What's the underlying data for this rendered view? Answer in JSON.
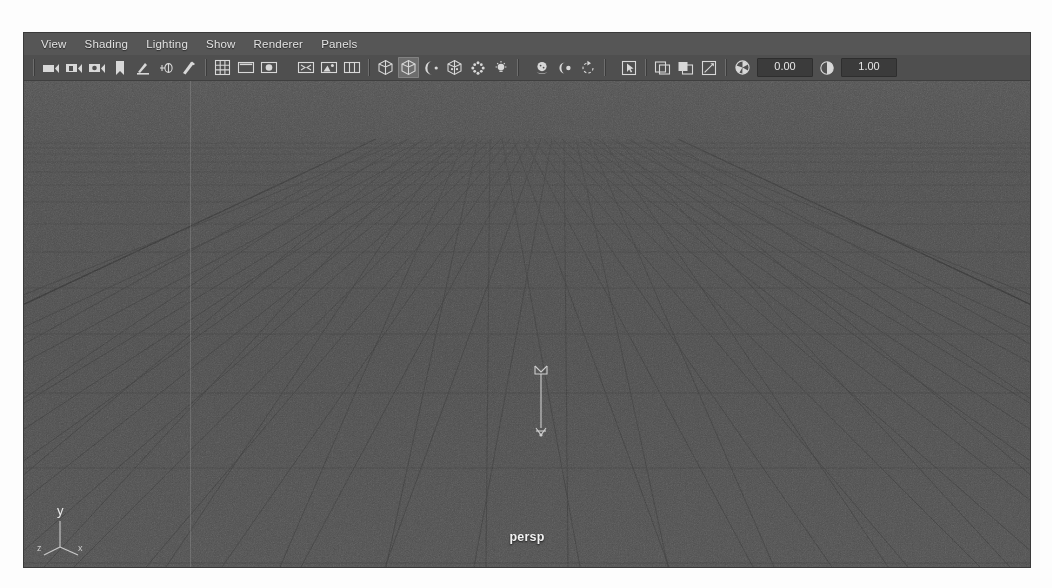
{
  "window": {
    "panel_name": "persp",
    "colors": {
      "panel_bg": "#4a4a4a",
      "menubar_bg": "#565656",
      "toolbar_bg": "#4f4f4f",
      "viewport_bg": "#4c4c4c",
      "grid_line": "#3a3a3a",
      "text": "#e2e2e2",
      "field_bg": "#3b3b3b"
    }
  },
  "menubar": {
    "items": [
      {
        "label": "View"
      },
      {
        "label": "Shading"
      },
      {
        "label": "Lighting"
      },
      {
        "label": "Show"
      },
      {
        "label": "Renderer"
      },
      {
        "label": "Panels"
      }
    ]
  },
  "toolbar": {
    "groups": [
      {
        "name": "camera-group",
        "buttons": [
          {
            "icon": "select-camera-icon",
            "active": false
          },
          {
            "icon": "camera-bookmark-icon",
            "active": false
          },
          {
            "icon": "camera-attributes-icon",
            "active": false
          },
          {
            "icon": "bookmark-icon",
            "active": false
          },
          {
            "icon": "two-d-pan-zoom-icon",
            "active": false
          },
          {
            "icon": "grease-pencil-icon",
            "active": false
          },
          {
            "icon": "xray-joints-icon",
            "active": false
          }
        ]
      },
      {
        "name": "gate-group",
        "buttons": [
          {
            "icon": "grid-icon",
            "active": false
          },
          {
            "icon": "film-gate-icon",
            "active": false
          },
          {
            "icon": "resolution-gate-icon",
            "active": false
          }
        ]
      },
      {
        "name": "display-group",
        "buttons": [
          {
            "icon": "gate-mask-icon",
            "active": false
          },
          {
            "icon": "image-plane-icon",
            "active": false
          },
          {
            "icon": "exposure-split-icon",
            "active": false
          }
        ]
      },
      {
        "name": "shading-group",
        "buttons": [
          {
            "icon": "wireframe-cube-icon",
            "active": false
          },
          {
            "icon": "smooth-shade-cube-icon",
            "active": true
          },
          {
            "icon": "shaded-sphere-icon",
            "active": false
          },
          {
            "icon": "textured-cube-icon",
            "active": false
          },
          {
            "icon": "wireframe-sphere-icon",
            "active": false
          },
          {
            "icon": "light-bulb-icon",
            "active": false
          }
        ]
      },
      {
        "name": "shadow-group",
        "buttons": [
          {
            "icon": "shadows-icon",
            "active": false
          },
          {
            "icon": "ambient-occlusion-icon",
            "active": false
          },
          {
            "icon": "motion-blur-icon",
            "active": false
          }
        ]
      },
      {
        "name": "selection-group",
        "buttons": [
          {
            "icon": "select-arrow-icon",
            "active": false
          }
        ]
      },
      {
        "name": "isolate-group",
        "buttons": [
          {
            "icon": "isolate-select-icon",
            "active": false
          },
          {
            "icon": "xray-shading-icon",
            "active": false
          },
          {
            "icon": "xray-active-components-icon",
            "active": false
          }
        ]
      }
    ],
    "exposure": {
      "icon": "exposure-aperture-icon",
      "value": "0.00"
    },
    "gamma": {
      "icon": "gamma-contrast-icon",
      "value": "1.00"
    }
  },
  "viewport": {
    "camera_label": "persp",
    "axis_gizmo": {
      "y_label": "y",
      "z_label": "z",
      "x_label": "x"
    },
    "manipulator": "directional-light-manipulator"
  }
}
